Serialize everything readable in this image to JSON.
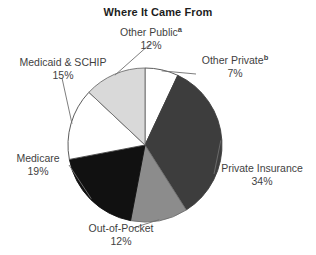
{
  "chart": {
    "title": "Where It Came From"
  },
  "chart_data": {
    "type": "pie",
    "title": "Where It Came From",
    "xlabel": "",
    "ylabel": "",
    "units": "percent",
    "start_angle_deg": 0,
    "direction": "clockwise",
    "legend": "none",
    "grid": false,
    "labels_outside": true,
    "categories": [
      "Other Private",
      "Private Insurance",
      "Out-of-Pocket",
      "Medicare",
      "Medicaid & SCHIP",
      "Other Public"
    ],
    "values": [
      7,
      34,
      12,
      19,
      15,
      12
    ],
    "slices": [
      {
        "label": "Other Private",
        "footnote": "b",
        "value": 7,
        "value_text": "7%",
        "color": "#ffffff",
        "stroke": "#4a4a4a",
        "start_deg": 0,
        "end_deg": 25.2,
        "leader_line": true
      },
      {
        "label": "Private Insurance",
        "footnote": "",
        "value": 34,
        "value_text": "34%",
        "color": "#3d3d3d",
        "stroke": "#3d3d3d",
        "start_deg": 25.2,
        "end_deg": 147.6,
        "leader_line": true
      },
      {
        "label": "Out-of-Pocket",
        "footnote": "",
        "value": 12,
        "value_text": "12%",
        "color": "#8c8c8c",
        "stroke": "#6f6f6f",
        "start_deg": 147.6,
        "end_deg": 190.8,
        "leader_line": true
      },
      {
        "label": "Medicare",
        "footnote": "",
        "value": 19,
        "value_text": "19%",
        "color": "#111111",
        "stroke": "#111111",
        "start_deg": 190.8,
        "end_deg": 259.2,
        "leader_line": true
      },
      {
        "label": "Medicaid & SCHIP",
        "footnote": "",
        "value": 15,
        "value_text": "15%",
        "color": "#ffffff",
        "stroke": "#4a4a4a",
        "start_deg": 259.2,
        "end_deg": 313.2,
        "leader_line": true
      },
      {
        "label": "Other Public",
        "footnote": "a",
        "value": 12,
        "value_text": "12%",
        "color": "#d9d9d9",
        "stroke": "#6f6f6f",
        "start_deg": 313.2,
        "end_deg": 360,
        "leader_line": true
      }
    ],
    "colors": {
      "private_insurance": "#3d3d3d",
      "out_of_pocket": "#8c8c8c",
      "medicare": "#111111",
      "medicaid_schip": "#ffffff",
      "other_public": "#d9d9d9",
      "other_private": "#ffffff",
      "outline": "#4a4a4a",
      "text": "#3f3f3f",
      "background": "#ffffff"
    }
  }
}
